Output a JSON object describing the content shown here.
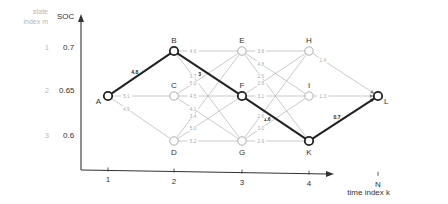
{
  "axes": {
    "y_title": "SOC",
    "state_title_line1": "state",
    "state_title_line2": "index m",
    "x_title": "time index k",
    "y_ticks": [
      {
        "state": "1",
        "soc": "0.7"
      },
      {
        "state": "2",
        "soc": "0.65"
      },
      {
        "state": "3",
        "soc": "0.6"
      }
    ],
    "x_ticks": [
      "1",
      "2",
      "3",
      "4",
      "N"
    ]
  },
  "nodes": [
    {
      "id": "A",
      "k": 0,
      "m": 1,
      "highlight": true,
      "label_side": "left"
    },
    {
      "id": "B",
      "k": 1,
      "m": 0,
      "highlight": true,
      "label_side": "top"
    },
    {
      "id": "C",
      "k": 1,
      "m": 1,
      "highlight": false,
      "label_side": "top"
    },
    {
      "id": "D",
      "k": 1,
      "m": 2,
      "highlight": false,
      "label_side": "bottom"
    },
    {
      "id": "E",
      "k": 2,
      "m": 0,
      "highlight": false,
      "label_side": "top"
    },
    {
      "id": "F",
      "k": 2,
      "m": 1,
      "highlight": true,
      "label_side": "top"
    },
    {
      "id": "G",
      "k": 2,
      "m": 2,
      "highlight": false,
      "label_side": "bottom"
    },
    {
      "id": "H",
      "k": 3,
      "m": 0,
      "highlight": false,
      "label_side": "top"
    },
    {
      "id": "I",
      "k": 3,
      "m": 1,
      "highlight": false,
      "label_side": "top"
    },
    {
      "id": "K",
      "k": 3,
      "m": 2,
      "highlight": true,
      "label_side": "bottom"
    },
    {
      "id": "L",
      "k": 4,
      "m": 1,
      "highlight": true,
      "label_side": "right"
    }
  ],
  "edges": [
    {
      "from": "A",
      "to": "B",
      "cost": "4.8",
      "bold": true
    },
    {
      "from": "A",
      "to": "C",
      "cost": "5.1",
      "bold": false
    },
    {
      "from": "A",
      "to": "D",
      "cost": "4.9",
      "bold": false
    },
    {
      "from": "B",
      "to": "E",
      "cost": "4.6",
      "bold": false
    },
    {
      "from": "B",
      "to": "F",
      "cost": "3",
      "bold": true
    },
    {
      "from": "B",
      "to": "G",
      "cost": "3.7",
      "bold": false
    },
    {
      "from": "C",
      "to": "E",
      "cost": "5.0",
      "bold": false
    },
    {
      "from": "C",
      "to": "F",
      "cost": "4.5",
      "bold": false
    },
    {
      "from": "C",
      "to": "G",
      "cost": "4.1",
      "bold": false
    },
    {
      "from": "D",
      "to": "E",
      "cost": "3.4",
      "bold": false
    },
    {
      "from": "D",
      "to": "F",
      "cost": "5.0",
      "bold": false
    },
    {
      "from": "D",
      "to": "G",
      "cost": "5.2",
      "bold": false
    },
    {
      "from": "E",
      "to": "H",
      "cost": "3.8",
      "bold": false
    },
    {
      "from": "E",
      "to": "I",
      "cost": "4.8",
      "bold": false
    },
    {
      "from": "E",
      "to": "K",
      "cost": "2.5",
      "bold": false
    },
    {
      "from": "F",
      "to": "H",
      "cost": "2.8",
      "bold": false
    },
    {
      "from": "F",
      "to": "I",
      "cost": "3.1",
      "bold": false
    },
    {
      "from": "F",
      "to": "K",
      "cost": "1.6",
      "bold": true
    },
    {
      "from": "G",
      "to": "H",
      "cost": "2.6",
      "bold": false
    },
    {
      "from": "G",
      "to": "I",
      "cost": "3.0",
      "bold": false
    },
    {
      "from": "G",
      "to": "K",
      "cost": "2.9",
      "bold": false
    },
    {
      "from": "H",
      "to": "L",
      "cost": "1.4",
      "bold": false
    },
    {
      "from": "I",
      "to": "L",
      "cost": "1.3",
      "bold": false
    },
    {
      "from": "K",
      "to": "L",
      "cost": "0.7",
      "bold": true
    }
  ]
}
